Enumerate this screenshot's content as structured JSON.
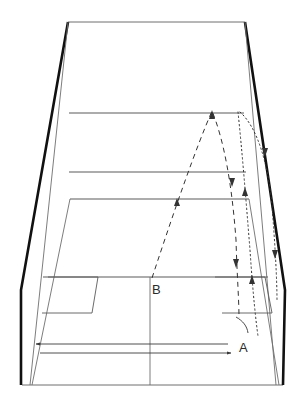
{
  "figure": {
    "type": "technical-line-diagram",
    "background_color": "#ffffff",
    "stroke_colors": {
      "outer_wall": "#111111",
      "inner_line": "#5a5a5a",
      "trajectory": "#333333",
      "label_text": "#2b2b2b"
    }
  },
  "labels": [
    {
      "id": "label-b",
      "text": "B",
      "x": 152,
      "y": 294
    },
    {
      "id": "label-a",
      "text": "A",
      "x": 239,
      "y": 352
    }
  ],
  "court": {
    "top_edge": {
      "x1": 68,
      "y1": 22,
      "x2": 245,
      "y2": 22
    },
    "bottom_edge": {
      "x1": 22,
      "y1": 385,
      "x2": 283,
      "y2": 385
    },
    "left_wall_thick": [
      [
        68,
        22
      ],
      [
        21,
        290
      ],
      [
        21,
        385
      ]
    ],
    "right_wall_thick": [
      [
        245,
        22
      ],
      [
        285,
        290
      ],
      [
        283,
        385
      ]
    ],
    "left_wall_thin": [
      [
        68,
        22
      ],
      [
        30,
        385
      ]
    ],
    "right_wall_thin": [
      [
        245,
        22
      ],
      [
        276,
        385
      ]
    ],
    "back_horizontals": [
      {
        "id": "back-line-1",
        "y": 113,
        "x1": 69,
        "x2": 244
      },
      {
        "id": "back-line-2",
        "y": 172,
        "x1": 69,
        "x2": 246
      },
      {
        "id": "back-line-3",
        "y": 199,
        "x1": 70,
        "x2": 249
      }
    ],
    "floor_left_diagonal": {
      "x1": 70,
      "y1": 199,
      "x2": 32,
      "y2": 385
    },
    "floor_right_diagonal": {
      "x1": 249,
      "y1": 199,
      "x2": 279,
      "y2": 385
    },
    "service_line": {
      "y": 277,
      "x1": 43,
      "x2": 268
    },
    "centre_line": {
      "x": 150,
      "y1": 277,
      "y2": 385
    },
    "left_box": [
      [
        48,
        277
      ],
      [
        98,
        277
      ],
      [
        92,
        313
      ],
      [
        42,
        313
      ]
    ],
    "right_box": [
      [
        215,
        277
      ],
      [
        265,
        277
      ],
      [
        272,
        313
      ],
      [
        222,
        313
      ]
    ]
  },
  "arrows": {
    "upper": {
      "id": "arrow-left",
      "direction": "left",
      "x1": 36,
      "y1": 344,
      "x2": 228,
      "y2": 344
    },
    "lower": {
      "id": "arrow-right",
      "direction": "right",
      "x1": 40,
      "y1": 353,
      "x2": 231,
      "y2": 353
    }
  },
  "trajectories": [
    {
      "id": "dashed-trajectory",
      "style": "dashed",
      "description": "high arcing lob from B rising to apex then descending to the rear right corner",
      "points": [
        [
          152,
          278
        ],
        [
          176,
          205
        ],
        [
          196,
          148
        ],
        [
          212,
          111
        ],
        [
          224,
          140
        ],
        [
          232,
          185
        ],
        [
          236,
          240
        ],
        [
          238,
          300
        ],
        [
          239,
          318
        ]
      ],
      "arrowheads": [
        {
          "x": 177,
          "y": 200,
          "dir": "up"
        },
        {
          "x": 212,
          "y": 112,
          "dir": "up"
        },
        {
          "x": 232,
          "y": 184,
          "dir": "down"
        },
        {
          "x": 236,
          "y": 266,
          "dir": "down"
        }
      ]
    },
    {
      "id": "dotted-trajectory-inner",
      "style": "dotted",
      "description": "near-vertical drive descending along the inner right tramline",
      "points": [
        [
          238,
          112
        ],
        [
          243,
          160
        ],
        [
          247,
          215
        ],
        [
          251,
          270
        ],
        [
          255,
          320
        ],
        [
          258,
          336
        ]
      ],
      "arrowheads": [
        {
          "x": 245,
          "y": 189,
          "dir": "up"
        },
        {
          "x": 252,
          "y": 276,
          "dir": "up"
        }
      ]
    },
    {
      "id": "dotted-trajectory-outer",
      "style": "dotted",
      "description": "outer curved shot bending right then descending to the side wall",
      "points": [
        [
          240,
          112
        ],
        [
          256,
          130
        ],
        [
          266,
          160
        ],
        [
          271,
          200
        ],
        [
          274,
          240
        ],
        [
          276,
          270
        ],
        [
          277,
          300
        ]
      ],
      "arrowheads": [
        {
          "x": 265,
          "y": 156,
          "dir": "down"
        },
        {
          "x": 275,
          "y": 258,
          "dir": "down"
        }
      ]
    }
  ],
  "annotation_arc": {
    "id": "angle-arc",
    "description": "small curved arc near label A indicating rebound angle",
    "path": [
      [
        236,
        317
      ],
      [
        243,
        323
      ],
      [
        248,
        332
      ]
    ]
  }
}
